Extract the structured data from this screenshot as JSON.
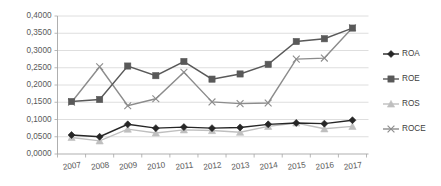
{
  "chart_data": {
    "type": "line",
    "title": "",
    "subtitle": "",
    "xlabel": "",
    "ylabel": "",
    "categories": [
      "2007",
      "2008",
      "2009",
      "2010",
      "2011",
      "2012",
      "2013",
      "2014",
      "2015",
      "2016",
      "2017"
    ],
    "x": [
      2007,
      2008,
      2009,
      2010,
      2011,
      2012,
      2013,
      2014,
      2015,
      2016,
      2017
    ],
    "ylim": [
      0.0,
      0.4
    ],
    "ytick_values": [
      0.0,
      0.05,
      0.1,
      0.15,
      0.2,
      0.25,
      0.3,
      0.35,
      0.4
    ],
    "ytick_labels": [
      "0,0000",
      "0,0500",
      "0,1000",
      "0,1500",
      "0,2000",
      "0,2500",
      "0,3000",
      "0,3500",
      "0,4000"
    ],
    "grid": true,
    "grid_axis": "y",
    "legend_position": "right",
    "decimal_separator": ",",
    "series": [
      {
        "name": "ROA",
        "color": "#262626",
        "marker": "diamond",
        "values": [
          0.055,
          0.05,
          0.086,
          0.075,
          0.078,
          0.075,
          0.077,
          0.086,
          0.09,
          0.088,
          0.098
        ]
      },
      {
        "name": "ROE",
        "color": "#595959",
        "marker": "square",
        "values": [
          0.152,
          0.158,
          0.255,
          0.227,
          0.268,
          0.217,
          0.232,
          0.26,
          0.326,
          0.334,
          0.365
        ]
      },
      {
        "name": "ROS",
        "color": "#bfbfbf",
        "marker": "triangle",
        "values": [
          0.048,
          0.038,
          0.072,
          0.061,
          0.07,
          0.068,
          0.063,
          0.08,
          0.09,
          0.073,
          0.08
        ]
      },
      {
        "name": "ROCE",
        "color": "#8c8c8c",
        "marker": "cross",
        "values": [
          0.15,
          0.253,
          0.14,
          0.16,
          0.237,
          0.151,
          0.146,
          0.148,
          0.275,
          0.278,
          0.366
        ]
      }
    ]
  },
  "legend": {
    "items": [
      {
        "label": "ROA"
      },
      {
        "label": "ROE"
      },
      {
        "label": "ROS"
      },
      {
        "label": "ROCE"
      }
    ]
  },
  "axes": {
    "y_axis_name": "value-axis",
    "x_axis_name": "category-axis"
  }
}
